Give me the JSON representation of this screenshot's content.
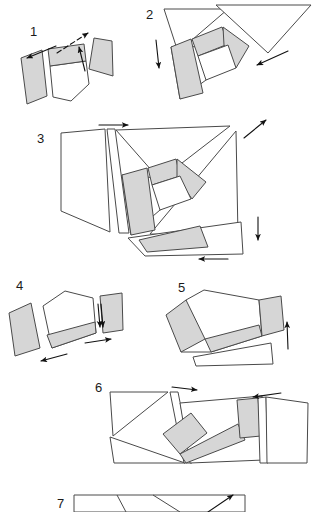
{
  "figure": {
    "type": "diagram",
    "panel_count": 7,
    "canvas": {
      "width": 315,
      "height": 512,
      "background": "#ffffff"
    },
    "colors": {
      "piece_fill_light": "#ffffff",
      "piece_fill_shaded": "#d6d6d6",
      "piece_outline": "#4a4a4a",
      "arrow": "#111111",
      "label_text": "#1a1a1a"
    }
  },
  "panels": [
    {
      "id": "panel-1",
      "label": "1",
      "label_pos": {
        "x": 30,
        "y": 36
      },
      "piece_count": 3,
      "arrow_count": 3,
      "pieces": [
        {
          "name": "piece-left-quad",
          "fill": "shaded",
          "points": "21,58 42,50 47,96 27,104"
        },
        {
          "name": "piece-center-top-band",
          "fill": "shaded",
          "points": "48,49 84,44 86,61 50,66"
        },
        {
          "name": "piece-center-lower",
          "fill": "white",
          "points": "50,66 86,61 89,84 71,101 53,97"
        },
        {
          "name": "piece-right-wedge",
          "fill": "shaded",
          "points": "94,38 112,41 113,76 89,69"
        }
      ],
      "arrows": [
        {
          "name": "arrow-up-right",
          "from": [
            57,
            52
          ],
          "to": [
            95,
            27
          ],
          "dashed": true
        },
        {
          "name": "arrow-down-left",
          "from": [
            55,
            47
          ],
          "to": [
            24,
            60
          ],
          "dashed": false
        },
        {
          "name": "arrow-up-short",
          "from": [
            85,
            70
          ],
          "to": [
            79,
            44
          ],
          "dashed": false
        }
      ]
    },
    {
      "id": "panel-2",
      "label": "2",
      "label_pos": {
        "x": 146,
        "y": 19
      },
      "piece_count": 5,
      "arrow_count": 2,
      "pieces": [
        {
          "name": "piece-big-triangle-left",
          "fill": "white",
          "points": "164,9 228,9 178,52"
        },
        {
          "name": "piece-big-triangle-right",
          "fill": "white",
          "points": "216,5 311,5 268,53"
        },
        {
          "name": "piece-shaded-left-strip",
          "fill": "shaded",
          "points": "171,47 191,39 203,93 180,99"
        },
        {
          "name": "piece-shaded-top-band",
          "fill": "shaded",
          "points": "192,39 222,27 228,44 198,56"
        },
        {
          "name": "piece-shaded-right-wedge",
          "fill": "shaded",
          "points": "223,27 248,46 237,67 223,45"
        },
        {
          "name": "piece-inner-white",
          "fill": "white",
          "points": "198,56 228,45 236,68 206,80"
        }
      ],
      "arrows": [
        {
          "name": "arrow-down-left-edge",
          "from": [
            156,
            40
          ],
          "to": [
            160,
            72
          ],
          "dashed": false
        },
        {
          "name": "arrow-down-left-diagonal",
          "from": [
            288,
            51
          ],
          "to": [
            253,
            67
          ],
          "dashed": false
        }
      ]
    },
    {
      "id": "panel-3",
      "label": "3",
      "label_pos": {
        "x": 37,
        "y": 143
      },
      "piece_count": 7,
      "arrow_count": 4,
      "pieces": [
        {
          "name": "piece-left-large-quad",
          "fill": "white",
          "points": "61,133 105,129 110,232 61,211"
        },
        {
          "name": "piece-thin-sliver",
          "fill": "white",
          "points": "107,129 115,129 129,233 119,233"
        },
        {
          "name": "piece-top-right-triangle",
          "fill": "white",
          "points": "116,130 230,126 160,180"
        },
        {
          "name": "piece-shaded-vertical",
          "fill": "shaded",
          "points": "122,175 147,168 155,230 131,235"
        },
        {
          "name": "piece-shaded-inner-band",
          "fill": "shaded",
          "points": "148,168 176,159 180,176 152,185"
        },
        {
          "name": "piece-shaded-right-wedge",
          "fill": "shaded",
          "points": "177,159 205,182 192,198 177,177"
        },
        {
          "name": "piece-center-white",
          "fill": "white",
          "points": "152,185 180,176 191,199 160,210"
        },
        {
          "name": "piece-right-triangle",
          "fill": "white",
          "points": "236,131 238,236 150,234"
        },
        {
          "name": "piece-bottom-shaded",
          "fill": "shaded",
          "points": "139,240 200,226 207,247 147,252"
        }
      ],
      "arrows": [
        {
          "name": "arrow-right-top",
          "from": [
            99,
            125
          ],
          "to": [
            132,
            125
          ],
          "dashed": false
        },
        {
          "name": "arrow-up-right-corner",
          "from": [
            245,
            137
          ],
          "to": [
            268,
            119
          ],
          "dashed": false
        },
        {
          "name": "arrow-down-right-side",
          "from": [
            258,
            217
          ],
          "to": [
            258,
            243
          ],
          "dashed": false
        },
        {
          "name": "arrow-left-bottom",
          "from": [
            228,
            259
          ],
          "to": [
            196,
            259
          ],
          "dashed": false
        }
      ]
    },
    {
      "id": "panel-4",
      "label": "4",
      "label_pos": {
        "x": 16,
        "y": 290
      },
      "piece_count": 4,
      "arrow_count": 4,
      "pieces": [
        {
          "name": "piece-left-shaded-quad",
          "fill": "shaded",
          "points": "9,313 31,303 40,348 15,356"
        },
        {
          "name": "piece-center-pentagon",
          "fill": "white",
          "points": "43,306 65,291 93,298 95,322 47,335"
        },
        {
          "name": "piece-center-lower-band",
          "fill": "shaded",
          "points": "47,335 95,322 96,333 52,348"
        },
        {
          "name": "piece-right-shaded-quad",
          "fill": "shaded",
          "points": "100,296 122,293 123,330 103,333"
        }
      ],
      "arrows": [
        {
          "name": "arrow-down-thin",
          "from": [
            98,
            306
          ],
          "to": [
            100,
            330
          ],
          "dashed": false
        },
        {
          "name": "arrow-right-lower",
          "from": [
            85,
            343
          ],
          "to": [
            114,
            338
          ],
          "dashed": false
        },
        {
          "name": "arrow-left-bottom",
          "from": [
            67,
            354
          ],
          "to": [
            38,
            362
          ],
          "dashed": false
        },
        {
          "name": "arrow-down-second",
          "from": [
            101,
            306
          ],
          "to": [
            103,
            330
          ],
          "dashed": false
        }
      ]
    },
    {
      "id": "panel-5",
      "label": "5",
      "label_pos": {
        "x": 178,
        "y": 292
      },
      "piece_count": 4,
      "arrow_count": 1,
      "pieces": [
        {
          "name": "piece-shaded-left-wedge",
          "fill": "shaded",
          "points": "166,315 185,300 205,339 181,352"
        },
        {
          "name": "piece-main-white-body",
          "fill": "white",
          "points": "186,300 204,290 259,300 261,334 206,339"
        },
        {
          "name": "piece-lower-shaded-band",
          "fill": "shaded",
          "points": "206,339 259,325 262,336 211,352"
        },
        {
          "name": "piece-right-shaded-quad",
          "fill": "shaded",
          "points": "259,300 281,296 284,330 262,336"
        },
        {
          "name": "piece-bottom-white-triangle",
          "fill": "white",
          "points": "193,357 271,343 273,363 196,365"
        }
      ],
      "arrows": [
        {
          "name": "arrow-up-right-side",
          "from": [
            288,
            347
          ],
          "to": [
            287,
            322
          ],
          "dashed": false
        }
      ]
    },
    {
      "id": "panel-6",
      "label": "6",
      "label_pos": {
        "x": 95,
        "y": 392
      },
      "piece_count": 6,
      "arrow_count": 2,
      "pieces": [
        {
          "name": "piece-left-triangle",
          "fill": "white",
          "points": "110,392 168,392 113,436"
        },
        {
          "name": "piece-left-lower-triangle",
          "fill": "white",
          "points": "110,436 185,463 114,463"
        },
        {
          "name": "piece-thin-strip",
          "fill": "white",
          "points": "170,392 178,392 192,463 184,463"
        },
        {
          "name": "piece-main-white-quad",
          "fill": "white",
          "points": "180,403 262,396 264,460 190,463"
        },
        {
          "name": "piece-shaded-diagonal",
          "fill": "shaded",
          "points": "163,434 191,413 207,433 180,454"
        },
        {
          "name": "piece-shaded-lower-band",
          "fill": "shaded",
          "points": "180,454 238,424 245,439 186,463"
        },
        {
          "name": "piece-shaded-right-block",
          "fill": "shaded",
          "points": "237,400 258,398 261,436 240,438"
        },
        {
          "name": "piece-right-white-quad",
          "fill": "white",
          "points": "265,397 307,402 306,463 266,463"
        },
        {
          "name": "piece-right-thin-strip",
          "fill": "white",
          "points": "258,398 266,397 268,463 260,463"
        }
      ],
      "arrows": [
        {
          "name": "arrow-right-top",
          "from": [
            172,
            387
          ],
          "to": [
            200,
            390
          ],
          "dashed": false
        },
        {
          "name": "arrow-left-top-right",
          "from": [
            280,
            393
          ],
          "to": [
            250,
            397
          ],
          "dashed": false
        }
      ]
    },
    {
      "id": "panel-7",
      "label": "7",
      "label_pos": {
        "x": 57,
        "y": 508
      },
      "piece_count": 3,
      "arrow_count": 1,
      "pieces": [
        {
          "name": "piece-outer-rect-partial",
          "fill": "white",
          "points": "74,495 245,495 245,512 74,512"
        },
        {
          "name": "piece-divider-line",
          "fill": "none",
          "points": "117,495 125,512"
        },
        {
          "name": "piece-diagonal-line",
          "fill": "none",
          "points": "155,495 178,512"
        }
      ],
      "arrows": [
        {
          "name": "arrow-up-right-partial",
          "from": [
            210,
            512
          ],
          "to": [
            233,
            495
          ],
          "dashed": false
        }
      ]
    }
  ]
}
